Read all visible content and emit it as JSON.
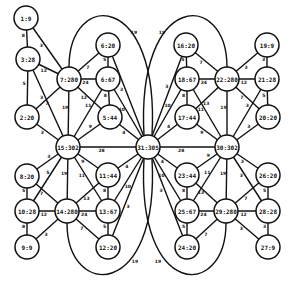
{
  "diagram": {
    "type": "weighted-graph",
    "node_radius": 12,
    "nodes": [
      {
        "id": "1",
        "label": "1:9",
        "x": 26,
        "y": 18
      },
      {
        "id": "3",
        "label": "3:28",
        "x": 28,
        "y": 59
      },
      {
        "id": "2",
        "label": "2:20",
        "x": 27,
        "y": 117
      },
      {
        "id": "7",
        "label": "7:280",
        "x": 69,
        "y": 79
      },
      {
        "id": "4",
        "label": "6:20",
        "x": 108,
        "y": 45
      },
      {
        "id": "6",
        "label": "6:67",
        "x": 108,
        "y": 79
      },
      {
        "id": "5",
        "label": "5:44",
        "x": 110,
        "y": 117
      },
      {
        "id": "15",
        "label": "15:302",
        "x": 68,
        "y": 147
      },
      {
        "id": "31",
        "label": "31:305",
        "x": 148,
        "y": 147
      },
      {
        "id": "30",
        "label": "30:302",
        "x": 227,
        "y": 147
      },
      {
        "id": "16",
        "label": "16:20",
        "x": 186,
        "y": 45
      },
      {
        "id": "18",
        "label": "18:67",
        "x": 187,
        "y": 79
      },
      {
        "id": "22",
        "label": "22:280",
        "x": 227,
        "y": 79
      },
      {
        "id": "19",
        "label": "19:9",
        "x": 267,
        "y": 45
      },
      {
        "id": "21",
        "label": "21:28",
        "x": 267,
        "y": 79
      },
      {
        "id": "20",
        "label": "20:20",
        "x": 268,
        "y": 117
      },
      {
        "id": "17",
        "label": "17:44",
        "x": 187,
        "y": 117
      },
      {
        "id": "8",
        "label": "8:20",
        "x": 27,
        "y": 176
      },
      {
        "id": "10",
        "label": "10:28",
        "x": 27,
        "y": 211
      },
      {
        "id": "9",
        "label": "9:9",
        "x": 27,
        "y": 247
      },
      {
        "id": "14",
        "label": "14:280",
        "x": 67,
        "y": 211
      },
      {
        "id": "11",
        "label": "11:44",
        "x": 108,
        "y": 175
      },
      {
        "id": "13",
        "label": "13:67",
        "x": 108,
        "y": 211
      },
      {
        "id": "12",
        "label": "12:20",
        "x": 108,
        "y": 247
      },
      {
        "id": "23",
        "label": "23:44",
        "x": 187,
        "y": 175
      },
      {
        "id": "25",
        "label": "25:67",
        "x": 187,
        "y": 211
      },
      {
        "id": "24",
        "label": "24:20",
        "x": 187,
        "y": 247
      },
      {
        "id": "29",
        "label": "29:280",
        "x": 226,
        "y": 211
      },
      {
        "id": "26",
        "label": "26:20",
        "x": 268,
        "y": 175
      },
      {
        "id": "28",
        "label": "28:28",
        "x": 268,
        "y": 211
      },
      {
        "id": "27",
        "label": "27:9",
        "x": 268,
        "y": 247
      }
    ],
    "edges": [
      {
        "from": "1",
        "to": "3",
        "w": "8"
      },
      {
        "from": "1",
        "to": "7",
        "w": "3"
      },
      {
        "from": "3",
        "to": "7",
        "w": "12"
      },
      {
        "from": "3",
        "to": "2",
        "w": "5"
      },
      {
        "from": "3",
        "to": "15",
        "w": "3"
      },
      {
        "from": "2",
        "to": "7",
        "w": "7"
      },
      {
        "from": "2",
        "to": "15",
        "w": "3"
      },
      {
        "from": "7",
        "to": "4",
        "w": "7"
      },
      {
        "from": "7",
        "to": "6",
        "w": "24"
      },
      {
        "from": "7",
        "to": "5",
        "w": "12"
      },
      {
        "from": "7",
        "to": "15",
        "w": "19"
      },
      {
        "from": "4",
        "to": "6",
        "w": "5"
      },
      {
        "from": "4",
        "to": "31",
        "w": "3"
      },
      {
        "from": "6",
        "to": "5",
        "w": "8"
      },
      {
        "from": "6",
        "to": "15",
        "w": "11"
      },
      {
        "from": "6",
        "to": "31",
        "w": "10"
      },
      {
        "from": "5",
        "to": "15",
        "w": "9"
      },
      {
        "from": "5",
        "to": "31",
        "w": "4"
      },
      {
        "from": "15",
        "to": "31",
        "w": "28"
      },
      {
        "from": "31",
        "to": "30",
        "w": "28"
      },
      {
        "from": "16",
        "to": "18",
        "w": "5"
      },
      {
        "from": "16",
        "to": "22",
        "w": "7"
      },
      {
        "from": "16",
        "to": "31",
        "w": "3"
      },
      {
        "from": "18",
        "to": "22",
        "w": "24"
      },
      {
        "from": "18",
        "to": "17",
        "w": "8"
      },
      {
        "from": "18",
        "to": "31",
        "w": "10"
      },
      {
        "from": "18",
        "to": "30",
        "w": "11"
      },
      {
        "from": "17",
        "to": "22",
        "w": "13"
      },
      {
        "from": "17",
        "to": "31",
        "w": "4"
      },
      {
        "from": "17",
        "to": "30",
        "w": "9"
      },
      {
        "from": "22",
        "to": "19",
        "w": "3"
      },
      {
        "from": "22",
        "to": "21",
        "w": "12"
      },
      {
        "from": "22",
        "to": "20",
        "w": "7"
      },
      {
        "from": "22",
        "to": "30",
        "w": "19"
      },
      {
        "from": "19",
        "to": "21",
        "w": "3"
      },
      {
        "from": "21",
        "to": "20",
        "w": "5"
      },
      {
        "from": "21",
        "to": "30",
        "w": "3"
      },
      {
        "from": "20",
        "to": "30",
        "w": "3"
      },
      {
        "from": "15",
        "to": "8",
        "w": "3"
      },
      {
        "from": "15",
        "to": "10",
        "w": "5"
      },
      {
        "from": "15",
        "to": "14",
        "w": "19"
      },
      {
        "from": "15",
        "to": "13",
        "w": "11"
      },
      {
        "from": "15",
        "to": "11",
        "w": "9"
      },
      {
        "from": "8",
        "to": "10",
        "w": "5"
      },
      {
        "from": "8",
        "to": "14",
        "w": "7"
      },
      {
        "from": "10",
        "to": "14",
        "w": "12"
      },
      {
        "from": "10",
        "to": "9",
        "w": "8"
      },
      {
        "from": "9",
        "to": "14",
        "w": "3"
      },
      {
        "from": "14",
        "to": "13",
        "w": "24"
      },
      {
        "from": "14",
        "to": "11",
        "w": "13"
      },
      {
        "from": "14",
        "to": "12",
        "w": "7"
      },
      {
        "from": "11",
        "to": "13",
        "w": "8"
      },
      {
        "from": "11",
        "to": "31",
        "w": "4"
      },
      {
        "from": "13",
        "to": "12",
        "w": "5"
      },
      {
        "from": "13",
        "to": "31",
        "w": "10"
      },
      {
        "from": "12",
        "to": "31",
        "w": "3"
      },
      {
        "from": "30",
        "to": "23",
        "w": "9"
      },
      {
        "from": "30",
        "to": "25",
        "w": "11"
      },
      {
        "from": "30",
        "to": "29",
        "w": "19"
      },
      {
        "from": "30",
        "to": "28",
        "w": "3"
      },
      {
        "from": "30",
        "to": "26",
        "w": "3"
      },
      {
        "from": "31",
        "to": "23",
        "w": "4"
      },
      {
        "from": "31",
        "to": "25",
        "w": "10"
      },
      {
        "from": "31",
        "to": "24",
        "w": "3"
      },
      {
        "from": "23",
        "to": "25",
        "w": "8"
      },
      {
        "from": "23",
        "to": "29",
        "w": "13"
      },
      {
        "from": "25",
        "to": "29",
        "w": "24"
      },
      {
        "from": "25",
        "to": "24",
        "w": "5"
      },
      {
        "from": "24",
        "to": "29",
        "w": "7"
      },
      {
        "from": "29",
        "to": "28",
        "w": "12"
      },
      {
        "from": "29",
        "to": "26",
        "w": "7"
      },
      {
        "from": "29",
        "to": "27",
        "w": "3"
      },
      {
        "from": "26",
        "to": "28",
        "w": "5"
      },
      {
        "from": "28",
        "to": "27",
        "w": "3"
      }
    ],
    "curved_edges": [
      {
        "from": "7",
        "to": "31",
        "w": "19",
        "path": "M69,67 C69,-10 160,-10 152,135",
        "lx": 134,
        "ly": 32
      },
      {
        "from": "22",
        "to": "31",
        "w": "19",
        "path": "M227,67 C227,-10 136,-10 144,135",
        "lx": 162,
        "ly": 32
      },
      {
        "from": "14",
        "to": "31",
        "w": "19",
        "path": "M67,223 C67,300 160,300 152,159",
        "lx": 135,
        "ly": 261
      },
      {
        "from": "29",
        "to": "31",
        "w": "19",
        "path": "M226,223 C226,300 136,300 144,159",
        "lx": 158,
        "ly": 261
      }
    ]
  }
}
